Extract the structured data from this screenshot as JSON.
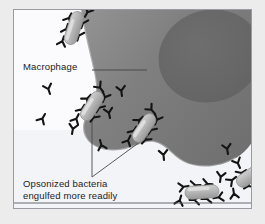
{
  "figure": {
    "background_color": "#ececec",
    "panel_background": "#fbfbfd",
    "border_color": "#9a9aa2"
  },
  "labels": {
    "macrophage": "Macrophage",
    "opsonized_line1": "Opsonized bacteria",
    "opsonized_line2": "engulfed more readily",
    "opsonized_full": "Opsonized bacteria\nengulfed more readily"
  },
  "colors": {
    "cell_body_light": "#8d8d8d",
    "cell_body_mid": "#7b7b7b",
    "cell_body_dark": "#6e6e6e",
    "nucleus": "#6a6a6a",
    "bacterium_fill": "#b5b5b5",
    "bacterium_edge": "#8e8e8e",
    "antibody": "#1a1a1a",
    "leader_line": "#44444a",
    "text": "#1b1b1b",
    "ground_line": "#55555c"
  },
  "structures": {
    "macrophage": {
      "name": "Macrophage",
      "description": "Large phagocytic cell occupying upper-right, with wavy pseudopod boundary"
    },
    "nucleus": {
      "name": "Nucleus",
      "description": "Darker interior blob in upper-right of macrophage"
    }
  },
  "bacteria": [
    {
      "id": "bacterium-top-left",
      "x": 60,
      "y": 18,
      "angle": -72,
      "length": 34,
      "width": 13,
      "antibody_count": 6
    },
    {
      "id": "bacterium-mid-left",
      "x": 78,
      "y": 108,
      "angle": -58,
      "length": 32,
      "width": 13,
      "antibody_count": 7
    },
    {
      "id": "bacterium-center",
      "x": 128,
      "y": 130,
      "angle": -56,
      "length": 32,
      "width": 13,
      "antibody_count": 7
    },
    {
      "id": "bacterium-bottom-right",
      "x": 200,
      "y": 193,
      "angle": -4,
      "length": 34,
      "width": 13,
      "antibody_count": 7
    },
    {
      "id": "bacterium-right-edge",
      "x": 250,
      "y": 178,
      "angle": -34,
      "length": 30,
      "width": 13,
      "antibody_count": 5
    }
  ],
  "leader_lines": [
    {
      "id": "leader-macrophage",
      "from": [
        78,
        60
      ],
      "to": [
        132,
        60
      ]
    },
    {
      "id": "leader-to-bacterium-mid",
      "from": [
        78,
        168
      ],
      "to": [
        78,
        103
      ]
    },
    {
      "id": "leader-to-bacterium-center",
      "from": [
        78,
        168
      ],
      "to": [
        133,
        128
      ]
    }
  ],
  "annotations": {
    "ground_line_y": 206
  }
}
